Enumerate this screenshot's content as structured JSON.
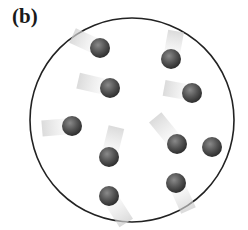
{
  "figure": {
    "label": "(b)",
    "container": {
      "cx": 132,
      "cy": 120,
      "r": 102,
      "stroke": "#222222"
    },
    "particle_color": "#555555",
    "particles": [
      {
        "x": 100,
        "y": 48,
        "dx": -22,
        "dy": -10
      },
      {
        "x": 110,
        "y": 88,
        "dx": -26,
        "dy": -6
      },
      {
        "x": 171,
        "y": 59,
        "dx": 4,
        "dy": -22
      },
      {
        "x": 192,
        "y": 93,
        "dx": -22,
        "dy": -4
      },
      {
        "x": 72,
        "y": 126,
        "dx": -24,
        "dy": 2
      },
      {
        "x": 177,
        "y": 144,
        "dx": -18,
        "dy": -22
      },
      {
        "x": 212,
        "y": 147,
        "dx": 0,
        "dy": 0
      },
      {
        "x": 109,
        "y": 157,
        "dx": 6,
        "dy": -24
      },
      {
        "x": 176,
        "y": 183,
        "dx": 10,
        "dy": 22
      },
      {
        "x": 109,
        "y": 196,
        "dx": 14,
        "dy": 22
      }
    ]
  }
}
